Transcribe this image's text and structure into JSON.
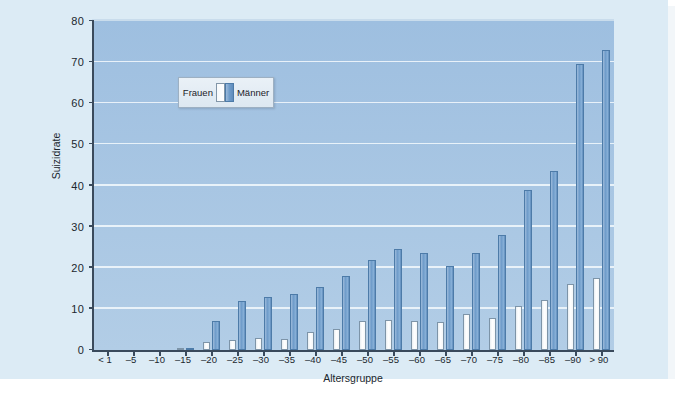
{
  "chart_data": {
    "type": "bar",
    "title": "",
    "subtitle": "",
    "xlabel": "Altersgruppe",
    "ylabel": "Suizidrate",
    "ylim": [
      0,
      80
    ],
    "yticks": [
      0,
      10,
      20,
      30,
      40,
      50,
      60,
      70,
      80
    ],
    "grid": true,
    "legend_position": "upper-left-inside",
    "categories": [
      "< 1",
      "–5",
      "–10",
      "–15",
      "–20",
      "–25",
      "–30",
      "–35",
      "–40",
      "–45",
      "–50",
      "–55",
      "–60",
      "–65",
      "–70",
      "–75",
      "–80",
      "–85",
      "–90",
      "> 90"
    ],
    "series": [
      {
        "name": "Frauen",
        "color": "#ffffff",
        "values": [
          0,
          0,
          0,
          0.3,
          2,
          2.5,
          3,
          2.8,
          4.5,
          5,
          7,
          7.2,
          7,
          6.8,
          8.7,
          7.8,
          10.6,
          12.2,
          16,
          17.6
        ]
      },
      {
        "name": "Männer",
        "color": "#6f9cca",
        "values": [
          0,
          0,
          0,
          0.4,
          7,
          12,
          13,
          13.5,
          15.3,
          18,
          22,
          24.5,
          23.5,
          20.5,
          23.7,
          28,
          39,
          43.5,
          69.5,
          73
        ]
      }
    ]
  },
  "legend": {
    "frauen_label": "Frauen",
    "maenner_label": "Männer"
  },
  "axes": {
    "y_title": "Suizidrate",
    "x_title": "Altersgruppe"
  }
}
